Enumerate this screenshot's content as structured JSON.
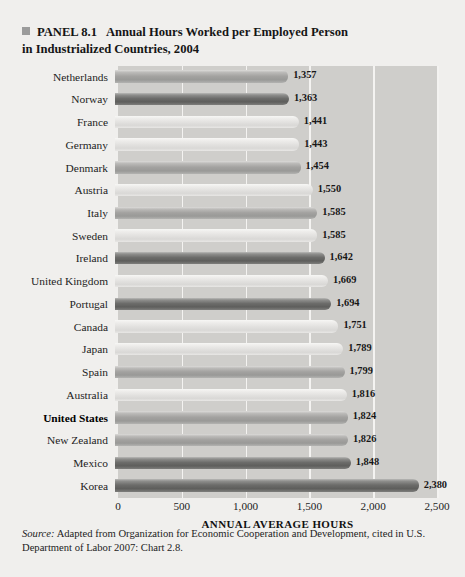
{
  "panel": {
    "bullet_icon": "square-bullet-icon",
    "label": "PANEL 8.1",
    "title": "Annual Hours Worked per Employed Person in Industrialized Countries, 2004"
  },
  "source": {
    "label": "Source:",
    "text": " Adapted from Organization for Economic Cooperation and Development, cited in U.S. Department of Labor 2007: Chart 2.8."
  },
  "chart_data": {
    "type": "bar",
    "orientation": "horizontal",
    "title": "Annual Hours Worked per Employed Person in Industrialized Countries, 2004",
    "xlabel": "ANNUAL AVERAGE HOURS",
    "ylabel": "",
    "xlim": [
      0,
      2500
    ],
    "xticks": [
      0,
      500,
      1000,
      1500,
      2000,
      2500
    ],
    "xticklabels": [
      "0",
      "500",
      "1,000",
      "1,500",
      "2,000",
      "2,500"
    ],
    "grid": true,
    "legend": "none",
    "highlight_category": "United States",
    "plot_background": "#cfcecb",
    "categories": [
      "Netherlands",
      "Norway",
      "France",
      "Germany",
      "Denmark",
      "Austria",
      "Italy",
      "Sweden",
      "Ireland",
      "United Kingdom",
      "Portugal",
      "Canada",
      "Japan",
      "Spain",
      "Australia",
      "United States",
      "New Zealand",
      "Mexico",
      "Korea"
    ],
    "values": [
      1357,
      1363,
      1441,
      1443,
      1454,
      1550,
      1585,
      1585,
      1642,
      1669,
      1694,
      1751,
      1789,
      1799,
      1816,
      1824,
      1826,
      1848,
      2380
    ],
    "value_labels": [
      "1,357",
      "1,363",
      "1,441",
      "1,443",
      "1,454",
      "1,550",
      "1,585",
      "1,585",
      "1,642",
      "1,669",
      "1,694",
      "1,751",
      "1,789",
      "1,799",
      "1,816",
      "1,824",
      "1,826",
      "1,848",
      "2,380"
    ],
    "bar_shades": [
      "mid",
      "dark",
      "light",
      "light",
      "mid",
      "light",
      "mid",
      "light",
      "dark",
      "light",
      "dark",
      "light",
      "light",
      "mid",
      "light",
      "mid",
      "mid",
      "dark",
      "dark"
    ]
  }
}
